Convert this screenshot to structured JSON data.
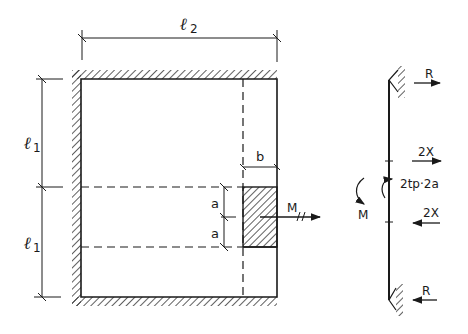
{
  "diagram": {
    "plate": {
      "dimension_width_label": "ℓ",
      "dimension_width_sub": "2",
      "dimension_height_label_top": "ℓ",
      "dimension_height_sub_top": "1",
      "dimension_height_label_bottom": "ℓ",
      "dimension_height_sub_bottom": "1",
      "block_width_label": "b",
      "block_half_height_label_top": "a",
      "block_half_height_label_bottom": "a",
      "moment_label": "M"
    },
    "side_view": {
      "top_reaction_label": "R",
      "bottom_reaction_label": "R",
      "upper_force_label": "2X",
      "lower_force_label": "2X",
      "moment_label": "M",
      "distributed_moment_label": "2tp·2a"
    },
    "colors": {
      "ink": "#1a1a1a",
      "background": "#ffffff"
    }
  }
}
